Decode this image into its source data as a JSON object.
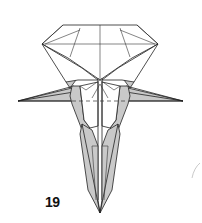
{
  "diagram": {
    "type": "origami-step",
    "step_number": "19",
    "colors": {
      "paper_white": "#ffffff",
      "paper_colored": "#c9c9c9",
      "line": "#222222"
    },
    "elements": [
      "top-diamond-fold",
      "left-wing-point",
      "right-wing-point",
      "center-valley",
      "dashed-valley-fold-line",
      "bottom-point",
      "faint-stray-mark"
    ]
  }
}
